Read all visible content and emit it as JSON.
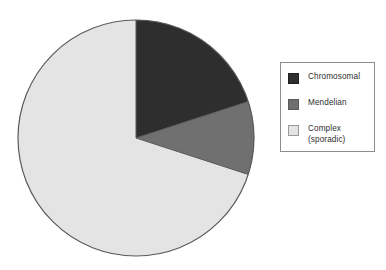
{
  "chart_data": {
    "type": "pie",
    "title": "",
    "subtitle": "",
    "xlabel": "",
    "ylabel": "",
    "grid": false,
    "legend_position": "right",
    "start_angle_deg": 0,
    "direction": "clockwise",
    "categories": [
      "Chromosomal",
      "Mendelian",
      "Complex (sporadic)"
    ],
    "values": [
      20,
      10,
      70
    ],
    "value_unit": "percent",
    "slices": [
      {
        "label": "Chromosomal",
        "value": 20,
        "angle_deg": 72,
        "color": "#2e2e2e"
      },
      {
        "label": "Mendelian",
        "value": 10,
        "angle_deg": 36,
        "color": "#707070"
      },
      {
        "label": "Complex (sporadic)",
        "value": 70,
        "angle_deg": 252,
        "color": "#e4e4e4"
      }
    ],
    "annotations": []
  },
  "pie": {
    "outline_color": "#5a5a5a",
    "center_x": 136,
    "center_y": 138,
    "radius": 118
  },
  "legend": {
    "border_color": "#8d8d8d",
    "background": "#ffffff",
    "items": [
      {
        "label": "Chromosomal",
        "color": "#2e2e2e",
        "swatch_border": "#1f1f1f"
      },
      {
        "label": "Mendelian",
        "color": "#707070",
        "swatch_border": "#5a5a5a"
      },
      {
        "label": "Complex\n(sporadic)",
        "color": "#e4e4e4",
        "swatch_border": "#9a9a9a"
      }
    ]
  }
}
